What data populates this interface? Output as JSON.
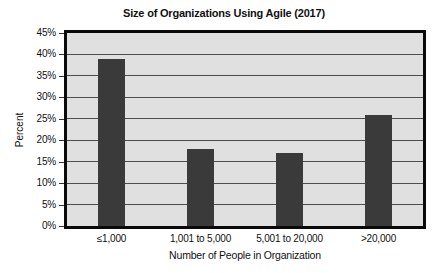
{
  "chart_data": {
    "type": "bar",
    "title": "Size of Organizations Using Agile (2017)",
    "xlabel": "Number of People in Organization",
    "ylabel": "Percent",
    "categories": [
      "≤1,000",
      "1,001 to 5,000",
      "5,001 to 20,000",
      ">20,000"
    ],
    "values": [
      39,
      18,
      17,
      26
    ],
    "ylim": [
      0,
      45
    ],
    "ytick_step": 5,
    "ytick_labels": [
      "0%",
      "5%",
      "10%",
      "15%",
      "20%",
      "25%",
      "30%",
      "35%",
      "40%",
      "45%"
    ],
    "grid": true,
    "legend": false,
    "colors": {
      "bar": "#3a3a3a",
      "plot_background": "#e0e0e0",
      "gridline": "#4d4d4d",
      "plot_border": "#0a0a0a",
      "page_background": "#ffffff",
      "text": "#111111"
    }
  }
}
